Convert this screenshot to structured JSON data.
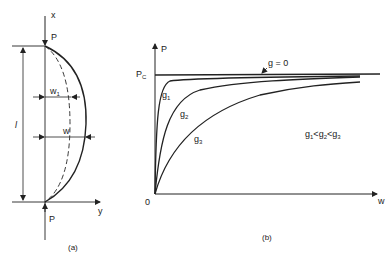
{
  "panel_a": {
    "caption": "(a)",
    "axis_x_label": "x",
    "axis_y_label": "y",
    "load_top_label": "P",
    "load_bottom_label": "P",
    "length_label": "l",
    "deflection_initial_label": "w",
    "deflection_initial_sub": "1",
    "deflection_total_label": "w"
  },
  "panel_b": {
    "caption": "(b)",
    "y_axis_label": "P",
    "x_axis_label": "w",
    "origin_label": "0",
    "pc_label": "P",
    "pc_sub": "C",
    "curve_labels": {
      "g0": "g = 0",
      "g1": "g",
      "g1_sub": "1",
      "g2": "g",
      "g2_sub": "2",
      "g3": "g",
      "g3_sub": "3"
    },
    "inequality": {
      "g": "g",
      "s1": "1",
      "lt": "<",
      "s2": "2",
      "s3": "3"
    }
  },
  "colors": {
    "ink": "#222222",
    "background": "#ffffff"
  }
}
